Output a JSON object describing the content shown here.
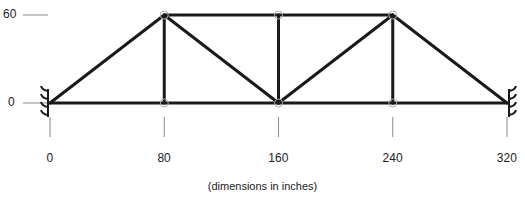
{
  "diagram": {
    "type": "truss",
    "caption": "(dimensions in inches)",
    "y_labels": [
      {
        "text": "60",
        "value": 60
      },
      {
        "text": "0",
        "value": 0
      }
    ],
    "x_labels": [
      {
        "text": "0",
        "value": 0
      },
      {
        "text": "80",
        "value": 80
      },
      {
        "text": "160",
        "value": 160
      },
      {
        "text": "240",
        "value": 240
      },
      {
        "text": "320",
        "value": 320
      }
    ],
    "nodes": [
      {
        "id": 1,
        "x": 0,
        "y": 0
      },
      {
        "id": 2,
        "x": 80,
        "y": 0
      },
      {
        "id": 3,
        "x": 160,
        "y": 0
      },
      {
        "id": 4,
        "x": 240,
        "y": 0
      },
      {
        "id": 5,
        "x": 320,
        "y": 0
      },
      {
        "id": 6,
        "x": 80,
        "y": 60
      },
      {
        "id": 7,
        "x": 160,
        "y": 60
      },
      {
        "id": 8,
        "x": 240,
        "y": 60
      }
    ],
    "members": [
      [
        1,
        2
      ],
      [
        2,
        3
      ],
      [
        3,
        4
      ],
      [
        4,
        5
      ],
      [
        6,
        7
      ],
      [
        7,
        8
      ],
      [
        1,
        6
      ],
      [
        6,
        2
      ],
      [
        6,
        3
      ],
      [
        7,
        3
      ],
      [
        3,
        8
      ],
      [
        8,
        4
      ],
      [
        8,
        5
      ]
    ],
    "supports": [
      {
        "node": 1,
        "side": "left",
        "type": "fixed"
      },
      {
        "node": 5,
        "side": "right",
        "type": "fixed"
      }
    ],
    "colors": {
      "member": "#1a1a1a",
      "node": "#aaaaaa",
      "tick": "#888888"
    }
  }
}
